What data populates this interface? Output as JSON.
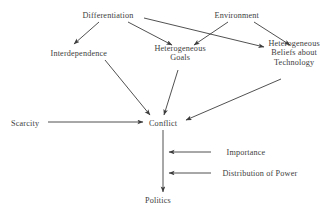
{
  "figure": {
    "kind": "causal-influence-diagram",
    "background_color": "#ffffff",
    "ink_color": "#3d3d3d",
    "canvas": {
      "width": 335,
      "height": 210
    }
  },
  "nodes": [
    {
      "id": "differentiation",
      "label": "Differentiation",
      "lines": [
        "Differentiation"
      ],
      "x": 108,
      "y": 15
    },
    {
      "id": "environment",
      "label": "Environment",
      "lines": [
        "Environment"
      ],
      "x": 237,
      "y": 15
    },
    {
      "id": "interdependence",
      "label": "Interdependence",
      "lines": [
        "Interdependence"
      ],
      "x": 79,
      "y": 53
    },
    {
      "id": "heterogeneous-goals",
      "label": "Heterogeneous Goals",
      "lines": [
        "Heterogeneous",
        "Goals"
      ],
      "x": 180,
      "y": 53
    },
    {
      "id": "heterogeneous-beliefs",
      "label": "Heterogeneous Beliefs about Technology",
      "lines": [
        "Heterogeneous",
        "Beliefs about",
        "Technology"
      ],
      "x": 294,
      "y": 53
    },
    {
      "id": "scarcity",
      "label": "Scarcity",
      "lines": [
        "Scarcity"
      ],
      "x": 25,
      "y": 123
    },
    {
      "id": "conflict",
      "label": "Conflict",
      "lines": [
        "Conflict"
      ],
      "x": 163,
      "y": 123
    },
    {
      "id": "importance",
      "label": "Importance",
      "lines": [
        "Importance"
      ],
      "x": 246,
      "y": 152
    },
    {
      "id": "distribution-of-power",
      "label": "Distribution of Power",
      "lines": [
        "Distribution of Power"
      ],
      "x": 260,
      "y": 173
    },
    {
      "id": "politics",
      "label": "Politics",
      "lines": [
        "Politics"
      ],
      "x": 158,
      "y": 200
    }
  ],
  "edges": [
    {
      "id": "differentiation-to-interdependence",
      "from": "differentiation",
      "to": "interdependence",
      "path": "M 99,22 L 74,44",
      "arrowhead": "end"
    },
    {
      "id": "differentiation-to-heterogeneous-goals",
      "from": "differentiation",
      "to": "heterogeneous-goals",
      "path": "M 128,22 L 172,45",
      "arrowhead": "end"
    },
    {
      "id": "differentiation-to-heterogeneous-beliefs",
      "from": "differentiation",
      "to": "heterogeneous-beliefs",
      "path": "M 144,18 L 264,47",
      "arrowhead": "end"
    },
    {
      "id": "environment-to-heterogeneous-goals",
      "from": "environment",
      "to": "heterogeneous-goals",
      "path": "M 228,22 L 194,45",
      "arrowhead": "end"
    },
    {
      "id": "environment-to-heterogeneous-beliefs",
      "from": "environment",
      "to": "heterogeneous-beliefs",
      "path": "M 254,22 L 290,45",
      "arrowhead": "end"
    },
    {
      "id": "interdependence-to-conflict",
      "from": "interdependence",
      "to": "conflict",
      "path": "M 105,60 L 150,115",
      "arrowhead": "end"
    },
    {
      "id": "heterogeneous-goals-to-conflict",
      "from": "heterogeneous-goals",
      "to": "conflict",
      "path": "M 178,70 L 164,115",
      "arrowhead": "end"
    },
    {
      "id": "heterogeneous-beliefs-to-conflict",
      "from": "heterogeneous-beliefs",
      "to": "conflict",
      "path": "M 281,79 L 186,120",
      "arrowhead": "end"
    },
    {
      "id": "scarcity-to-conflict",
      "from": "scarcity",
      "to": "conflict",
      "path": "M 48,122 L 143,122",
      "arrowhead": "end"
    },
    {
      "id": "conflict-to-politics",
      "from": "conflict",
      "to": "politics",
      "path": "M 163,130 L 163,192",
      "arrowhead": "end"
    },
    {
      "id": "importance-to-conflict-politics-link",
      "from": "importance",
      "to": "conflict-politics-link",
      "path": "M 211,152 L 169,152",
      "arrowhead": "end"
    },
    {
      "id": "distribution-of-power-to-conflict-politics-link",
      "from": "distribution-of-power",
      "to": "conflict-politics-link",
      "path": "M 211,173 L 169,173",
      "arrowhead": "end"
    }
  ]
}
